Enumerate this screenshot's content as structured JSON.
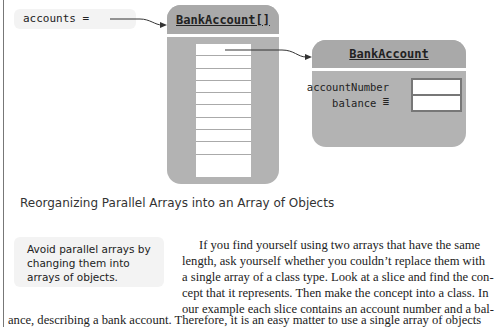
{
  "diagram": {
    "variable_label": "accounts =",
    "array_object": {
      "title": "BankAccount[]",
      "cell_count": 10
    },
    "bank_account_object": {
      "title": "BankAccount",
      "fields": [
        {
          "name": "accountNumber ="
        },
        {
          "name": "balance ="
        }
      ]
    },
    "colors": {
      "object_fill": "#b3b3b3",
      "header_fill": "#a9a9a9",
      "pill_fill": "#f3f3f3"
    }
  },
  "caption": "Reorganizing Parallel Arrays into an Array of Objects",
  "tip": "Avoid parallel arrays by changing them into arrays of objects.",
  "paragraph": {
    "lines": [
      "If you find yourself using two arrays that have the same",
      "length, ask yourself whether you couldn’t replace them with",
      "a single array of a class type. Look at a slice and find the con-",
      "cept that it represents. Then make the concept into a class. In",
      "our example each slice contains an account number and a bal-",
      "ance, describing a bank account. Therefore, it is an easy matter to use a single array of objects"
    ]
  }
}
